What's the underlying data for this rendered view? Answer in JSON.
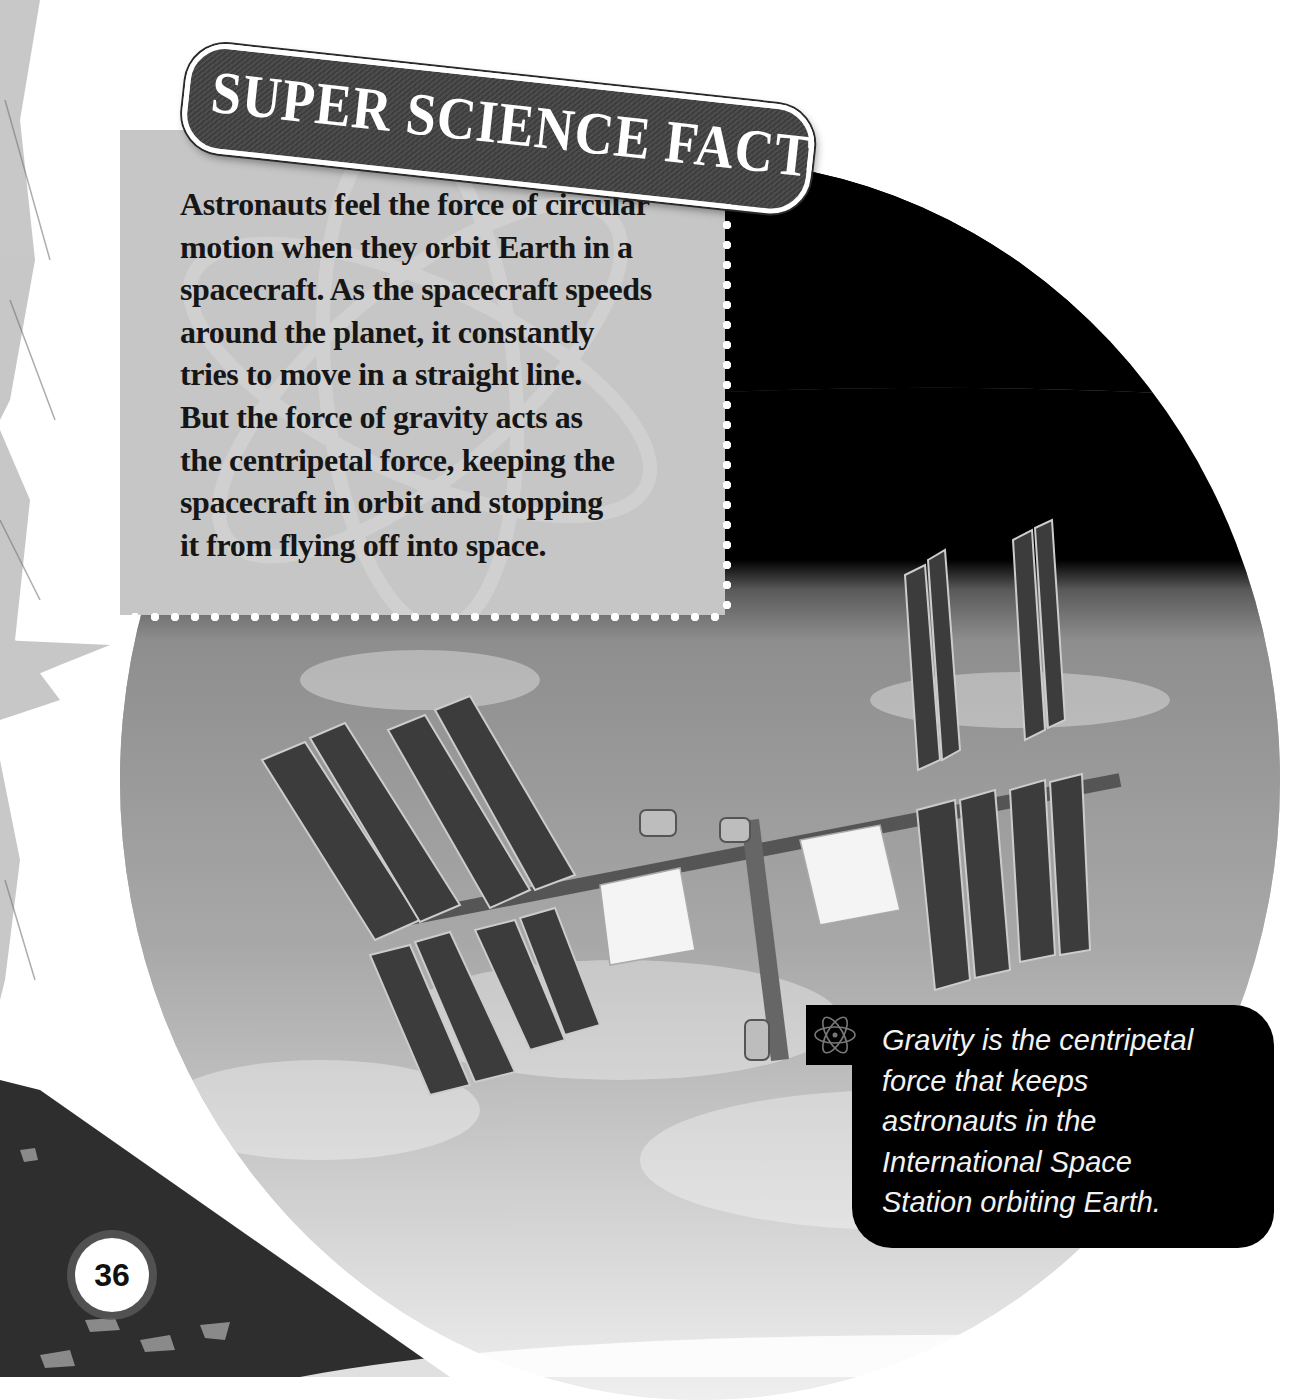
{
  "banner": {
    "title": "SUPER SCIENCE FACT"
  },
  "fact": {
    "lines": [
      "Astronauts feel the force of circular",
      "motion when they orbit Earth in a",
      "spacecraft. As the spacecraft speeds",
      "around the planet, it constantly",
      "tries to move in a straight line.",
      "But the force of gravity acts as",
      "the centripetal force, keeping the",
      "spacecraft in orbit and stopping",
      "it from flying off into space."
    ]
  },
  "caption": {
    "icon": "atom-icon",
    "lines": [
      "Gravity is the centripetal",
      "force that keeps",
      "astronauts in the",
      "International Space",
      "Station orbiting Earth."
    ]
  },
  "photo": {
    "subject": "International Space Station orbiting Earth"
  },
  "page": {
    "number": "36"
  },
  "colors": {
    "banner": "#444444",
    "fact_box": "#c6c6c6",
    "caption_bg": "#000000",
    "caption_text": "#f2f2f2"
  }
}
